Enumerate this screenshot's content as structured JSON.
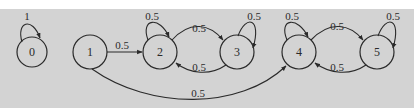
{
  "diagram": {
    "type": "markov-chain-state-transition",
    "colors": {
      "background": "#d3d3d3",
      "top_strip": "#ffffff",
      "stroke": "#2a2a2a"
    },
    "nodes": [
      {
        "id": "0",
        "label": "0"
      },
      {
        "id": "1",
        "label": "1"
      },
      {
        "id": "2",
        "label": "2"
      },
      {
        "id": "3",
        "label": "3"
      },
      {
        "id": "4",
        "label": "4"
      },
      {
        "id": "5",
        "label": "5"
      }
    ],
    "edges": [
      {
        "from": "0",
        "to": "0",
        "label": "1"
      },
      {
        "from": "1",
        "to": "2",
        "label": "0.5"
      },
      {
        "from": "1",
        "to": "4",
        "label": "0.5"
      },
      {
        "from": "2",
        "to": "2",
        "label": "0.5"
      },
      {
        "from": "2",
        "to": "3",
        "label": "0.5"
      },
      {
        "from": "3",
        "to": "2",
        "label": "0.5"
      },
      {
        "from": "3",
        "to": "3",
        "label": "0.5"
      },
      {
        "from": "4",
        "to": "4",
        "label": "0.5"
      },
      {
        "from": "4",
        "to": "5",
        "label": "0.5"
      },
      {
        "from": "5",
        "to": "4",
        "label": "0.5"
      },
      {
        "from": "5",
        "to": "5",
        "label": "0.5"
      }
    ]
  }
}
